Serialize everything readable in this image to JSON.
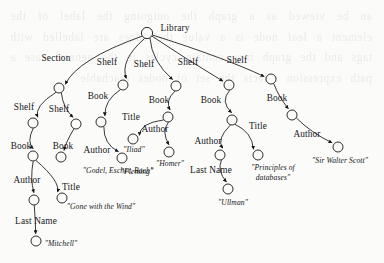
{
  "figure": {
    "kind": "semistructured-data-graph",
    "root_label": "Library",
    "background_color": "#fbfbf9",
    "ink_color": "#17171a",
    "bleed_through_text": "an be viewed as a graph the outgoing the label of the element a leaf node is a value the edges are labelled with tags and the graph may contain cycles in the general case a path expression selects the set of nodes reachable"
  },
  "nodes": [
    {
      "id": "root",
      "x": 147,
      "y": 33,
      "r": 5.6
    },
    {
      "id": "section",
      "x": 59,
      "y": 88,
      "r": 5.0
    },
    {
      "id": "shelf1",
      "x": 123,
      "y": 85,
      "r": 5.0
    },
    {
      "id": "shelf2",
      "x": 176,
      "y": 86,
      "r": 5.0
    },
    {
      "id": "shelf3",
      "x": 229,
      "y": 85,
      "r": 5.0
    },
    {
      "id": "shelf4",
      "x": 271,
      "y": 79,
      "r": 5.0
    },
    {
      "id": "shelfA",
      "x": 33,
      "y": 123,
      "r": 5.0
    },
    {
      "id": "shelfB",
      "x": 76,
      "y": 124,
      "r": 5.0
    },
    {
      "id": "bookA",
      "x": 33,
      "y": 156,
      "r": 5.0
    },
    {
      "id": "bookB",
      "x": 61,
      "y": 157,
      "r": 5.0
    },
    {
      "id": "bookC",
      "x": 101,
      "y": 122,
      "r": 5.0
    },
    {
      "id": "bookD",
      "x": 168,
      "y": 117,
      "r": 5.0
    },
    {
      "id": "bookE",
      "x": 232,
      "y": 120,
      "r": 5.0
    },
    {
      "id": "bookF",
      "x": 292,
      "y": 115,
      "r": 5.0
    },
    {
      "id": "authorA",
      "x": 34,
      "y": 200,
      "r": 5.0
    },
    {
      "id": "titleA",
      "x": 62,
      "y": 198,
      "r": 5.0
    },
    {
      "id": "lastNameA",
      "x": 36,
      "y": 241,
      "r": 5.0
    },
    {
      "id": "authorC",
      "x": 122,
      "y": 158,
      "r": 5.0
    },
    {
      "id": "titleD",
      "x": 133,
      "y": 139,
      "r": 5.0
    },
    {
      "id": "authorD",
      "x": 169,
      "y": 152,
      "r": 5.0
    },
    {
      "id": "authorE",
      "x": 220,
      "y": 155,
      "r": 5.0
    },
    {
      "id": "titleE",
      "x": 258,
      "y": 155,
      "r": 5.0
    },
    {
      "id": "lastNameE",
      "x": 228,
      "y": 189,
      "r": 5.0
    },
    {
      "id": "authorF",
      "x": 338,
      "y": 147,
      "r": 5.0
    }
  ],
  "edges": [
    {
      "from": "root",
      "to": "section",
      "label": "Section",
      "label_x": 56,
      "label_y": 58
    },
    {
      "from": "root",
      "to": "shelf1",
      "label": "Shelf",
      "label_x": 107,
      "label_y": 62
    },
    {
      "from": "root",
      "to": "shelf2",
      "label": "Shelf",
      "label_x": 144,
      "label_y": 64
    },
    {
      "from": "root",
      "to": "shelf3",
      "label": "Shelf",
      "label_x": 188,
      "label_y": 62
    },
    {
      "from": "root",
      "to": "shelf4",
      "label": "Shelf",
      "label_x": 237,
      "label_y": 60
    },
    {
      "from": "section",
      "to": "shelfA",
      "label": "Shelf",
      "label_x": 24,
      "label_y": 107
    },
    {
      "from": "section",
      "to": "shelfB",
      "label": "Shelf",
      "label_x": 59,
      "label_y": 109
    },
    {
      "from": "shelfA",
      "to": "bookA",
      "label": "Book",
      "label_x": 21,
      "label_y": 146
    },
    {
      "from": "shelfB",
      "to": "bookB",
      "label": "Book",
      "label_x": 63,
      "label_y": 146
    },
    {
      "from": "shelf1",
      "to": "bookC",
      "label": "Book",
      "label_x": 98,
      "label_y": 96
    },
    {
      "from": "shelf2",
      "to": "bookD",
      "label": "Book",
      "label_x": 159,
      "label_y": 100
    },
    {
      "from": "shelf3",
      "to": "bookE",
      "label": "Book",
      "label_x": 211,
      "label_y": 100
    },
    {
      "from": "shelf4",
      "to": "bookF",
      "label": "Book",
      "label_x": 277,
      "label_y": 98
    },
    {
      "from": "bookA",
      "to": "authorA",
      "label": "Author",
      "label_x": 27,
      "label_y": 180
    },
    {
      "from": "bookA",
      "to": "titleA",
      "label": "Title",
      "label_x": 71,
      "label_y": 187
    },
    {
      "from": "authorA",
      "to": "lastNameA",
      "label": "Last Name",
      "label_x": 36,
      "label_y": 221
    },
    {
      "from": "bookC",
      "to": "authorC",
      "label": "Author",
      "label_x": 97,
      "label_y": 150
    },
    {
      "from": "bookD",
      "to": "titleD",
      "label": "Title",
      "label_x": 131,
      "label_y": 117
    },
    {
      "from": "bookD",
      "to": "authorD",
      "label": "Author",
      "label_x": 155,
      "label_y": 129
    },
    {
      "from": "bookE",
      "to": "authorE",
      "label": "Author",
      "label_x": 208,
      "label_y": 141
    },
    {
      "from": "bookE",
      "to": "titleE",
      "label": "Title",
      "label_x": 258,
      "label_y": 126
    },
    {
      "from": "authorE",
      "to": "lastNameE",
      "label": "Last Name",
      "label_x": 211,
      "label_y": 170
    },
    {
      "from": "bookF",
      "to": "authorF",
      "label": "Author",
      "label_x": 307,
      "label_y": 134
    }
  ],
  "leaf_values": [
    {
      "id": "val-gbe",
      "node": "bookB",
      "text": "\"Godel, Escher, Bach\"",
      "x": 118,
      "y": 170,
      "lines": 1
    },
    {
      "id": "val-gwtw",
      "node": "titleA",
      "text": "\"Gone with the Wind\"",
      "x": 101,
      "y": 206,
      "lines": 1
    },
    {
      "id": "val-mitchell",
      "node": "lastNameA",
      "text": "\"Mitchell\"",
      "x": 61,
      "y": 243,
      "lines": 1
    },
    {
      "id": "val-fleming",
      "node": "authorC",
      "text": "\"Fleming\"",
      "x": 137,
      "y": 171,
      "lines": 1
    },
    {
      "id": "val-iliad",
      "node": "titleD",
      "text": "\"Iliad\"",
      "x": 134,
      "y": 149,
      "lines": 1
    },
    {
      "id": "val-homer",
      "node": "authorD",
      "text": "\"Homer\"",
      "x": 170,
      "y": 163,
      "lines": 1
    },
    {
      "id": "val-ullman",
      "node": "lastNameE",
      "text": "\"Ullman\"",
      "x": 233,
      "y": 202,
      "lines": 1
    },
    {
      "id": "val-principles",
      "node": "titleE",
      "text": "\"Principles of databases\"",
      "x": 273,
      "y": 172,
      "lines": 2
    },
    {
      "id": "val-scott",
      "node": "authorF",
      "text": "\"Sir Walter Scott\"",
      "x": 340,
      "y": 160,
      "lines": 1
    }
  ],
  "root_label_position": {
    "x": 175,
    "y": 28
  }
}
